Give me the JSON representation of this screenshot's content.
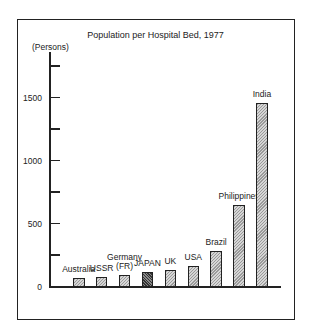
{
  "chart_data": {
    "type": "bar",
    "title": "Population per Hospital Bed, 1977",
    "ylabel": "(Persons)",
    "xlabel": "",
    "ylim": [
      0,
      1800
    ],
    "yticks": [
      0,
      250,
      500,
      750,
      1000,
      1250,
      1500,
      1750
    ],
    "ytick_labels": [
      "0",
      "",
      "500",
      "",
      "1000",
      "",
      "1500",
      ""
    ],
    "grid": false,
    "legend": null,
    "categories": [
      "Australia",
      "USSR",
      "Germany (FR)",
      "JAPAN",
      "UK",
      "USA",
      "Brazil",
      "Philippines",
      "India"
    ],
    "category_display": [
      [
        "Australia"
      ],
      [
        "USSR"
      ],
      [
        "Germany",
        "(FR)"
      ],
      [
        "JAPAN"
      ],
      [
        "UK"
      ],
      [
        "USA"
      ],
      [
        "Brazil"
      ],
      [
        "Philippines"
      ],
      [
        "India"
      ]
    ],
    "values": [
      67,
      80,
      93,
      115,
      133,
      167,
      283,
      648,
      1455
    ],
    "highlight": "JAPAN",
    "colors": {
      "default": "#b5b5b5",
      "highlight": "#555555",
      "axis": "#222222"
    }
  }
}
